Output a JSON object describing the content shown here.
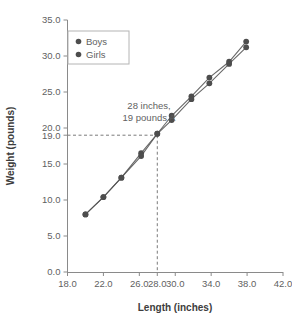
{
  "chart_data": {
    "type": "line",
    "title": "",
    "xlabel": "Length (inches)",
    "ylabel": "Weight (pounds)",
    "xlim": [
      18.0,
      42.0
    ],
    "ylim": [
      0.0,
      35.0
    ],
    "xticks": [
      "18.0",
      "22.0",
      "26.0",
      "28.0",
      "30.0",
      "34.0",
      "38.0",
      "42.0"
    ],
    "xtick_values": [
      18.0,
      22.0,
      26.0,
      28.0,
      30.0,
      34.0,
      38.0,
      42.0
    ],
    "yticks": [
      "0.0",
      "5.0",
      "10.0",
      "15.0",
      "19.0",
      "20.0",
      "25.0",
      "30.0",
      "35.0"
    ],
    "ytick_values": [
      0.0,
      5.0,
      10.0,
      15.0,
      19.0,
      20.0,
      25.0,
      30.0,
      35.0
    ],
    "grid": false,
    "legend_position": "top-left",
    "marker": "circle",
    "series": [
      {
        "name": "Boys",
        "color": "#4d4d4d",
        "x": [
          20.0,
          22.0,
          24.0,
          26.2,
          28.0,
          29.6,
          31.8,
          33.8,
          36.0,
          37.9
        ],
        "values": [
          8.0,
          10.4,
          13.1,
          16.5,
          19.2,
          21.7,
          24.4,
          27.0,
          29.2,
          32.0
        ]
      },
      {
        "name": "Girls",
        "color": "#4d4d4d",
        "x": [
          20.0,
          22.0,
          24.0,
          26.2,
          28.0,
          29.6,
          31.8,
          33.8,
          36.0,
          37.9
        ],
        "values": [
          8.0,
          10.4,
          13.1,
          16.1,
          19.2,
          21.1,
          24.0,
          26.2,
          28.9,
          31.2
        ]
      }
    ],
    "annotations": [
      {
        "name": "reference-point",
        "line1": "28 inches,",
        "line2": "19 pounds A",
        "x": 28.0,
        "y": 19.0
      }
    ]
  },
  "legend": {
    "entries": [
      {
        "label": "Boys"
      },
      {
        "label": "Girls"
      }
    ]
  },
  "axes": {
    "x_title": "Length (inches)",
    "y_title": "Weight (pounds)"
  }
}
